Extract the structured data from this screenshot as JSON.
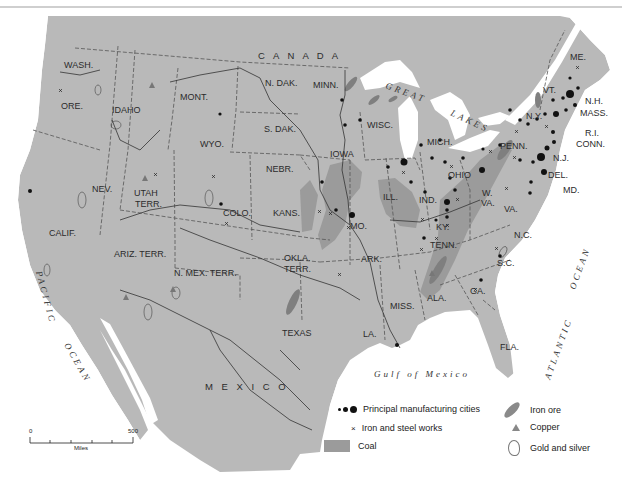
{
  "colors": {
    "land": "#b7b7b7",
    "land_other": "#bdbdbd",
    "water": "#ffffff",
    "coal": "#9a9a9a",
    "iron_ore": "#8a8a8a",
    "border": "#444444",
    "river": "#333333"
  },
  "regions": {
    "countries": [
      "C A N A D A",
      "M E X I C O"
    ],
    "states": [
      {
        "id": "wash",
        "label": "WASH."
      },
      {
        "id": "ore",
        "label": "ORE."
      },
      {
        "id": "idaho",
        "label": "IDAHO"
      },
      {
        "id": "mont",
        "label": "MONT."
      },
      {
        "id": "wyo",
        "label": "WYO."
      },
      {
        "id": "ndak",
        "label": "N. DAK."
      },
      {
        "id": "sdak",
        "label": "S. DAK."
      },
      {
        "id": "minn",
        "label": "MINN."
      },
      {
        "id": "wisc",
        "label": "WISC."
      },
      {
        "id": "mich",
        "label": "MICH."
      },
      {
        "id": "iowa",
        "label": "IOWA"
      },
      {
        "id": "nebr",
        "label": "NEBR."
      },
      {
        "id": "nev",
        "label": "NEV."
      },
      {
        "id": "utah",
        "label": "UTAH"
      },
      {
        "id": "utah2",
        "label": "TERR."
      },
      {
        "id": "calif",
        "label": "CALIF."
      },
      {
        "id": "colo",
        "label": "COLO."
      },
      {
        "id": "kans",
        "label": "KANS."
      },
      {
        "id": "ill",
        "label": "ILL."
      },
      {
        "id": "ind",
        "label": "IND."
      },
      {
        "id": "ohio",
        "label": "OHIO"
      },
      {
        "id": "mo",
        "label": "MO."
      },
      {
        "id": "ky",
        "label": "KY."
      },
      {
        "id": "wva1",
        "label": "W."
      },
      {
        "id": "wva2",
        "label": "VA."
      },
      {
        "id": "va",
        "label": "VA."
      },
      {
        "id": "penn",
        "label": "PENN."
      },
      {
        "id": "ny",
        "label": "N.Y."
      },
      {
        "id": "vt",
        "label": "VT."
      },
      {
        "id": "me",
        "label": "ME."
      },
      {
        "id": "nh",
        "label": "N.H."
      },
      {
        "id": "mass",
        "label": "MASS."
      },
      {
        "id": "ri",
        "label": "R.I."
      },
      {
        "id": "conn",
        "label": "CONN."
      },
      {
        "id": "nj",
        "label": "N.J."
      },
      {
        "id": "del",
        "label": "DEL."
      },
      {
        "id": "md",
        "label": "MD."
      },
      {
        "id": "ariz",
        "label": "ARIZ. TERR."
      },
      {
        "id": "nmex",
        "label": "N. MEX. TERR."
      },
      {
        "id": "okla1",
        "label": "OKLA."
      },
      {
        "id": "okla2",
        "label": "TERR."
      },
      {
        "id": "ark",
        "label": "ARK."
      },
      {
        "id": "tenn",
        "label": "TENN."
      },
      {
        "id": "nc",
        "label": "N.C."
      },
      {
        "id": "sc",
        "label": "S.C."
      },
      {
        "id": "ga",
        "label": "GA."
      },
      {
        "id": "ala",
        "label": "ALA."
      },
      {
        "id": "miss",
        "label": "MISS."
      },
      {
        "id": "la",
        "label": "LA."
      },
      {
        "id": "texas",
        "label": "TEXAS"
      },
      {
        "id": "fla",
        "label": "FLA."
      }
    ],
    "water": {
      "great": "GREAT",
      "lakes": "LAKES",
      "pacific": "PACIFIC",
      "pacific_ocean": "OCEAN",
      "atlantic": "ATLANTIC",
      "atlantic_ocean": "OCEAN",
      "gulf": "Gulf of Mexico"
    }
  },
  "legend": {
    "cities": "Principal manufacturing cities",
    "iron_steel": "Iron and steel works",
    "coal": "Coal",
    "iron_ore": "Iron ore",
    "copper": "Copper",
    "gold_silver": "Gold and silver"
  },
  "scale": {
    "min": "0",
    "max": "500",
    "unit": "Miles"
  }
}
